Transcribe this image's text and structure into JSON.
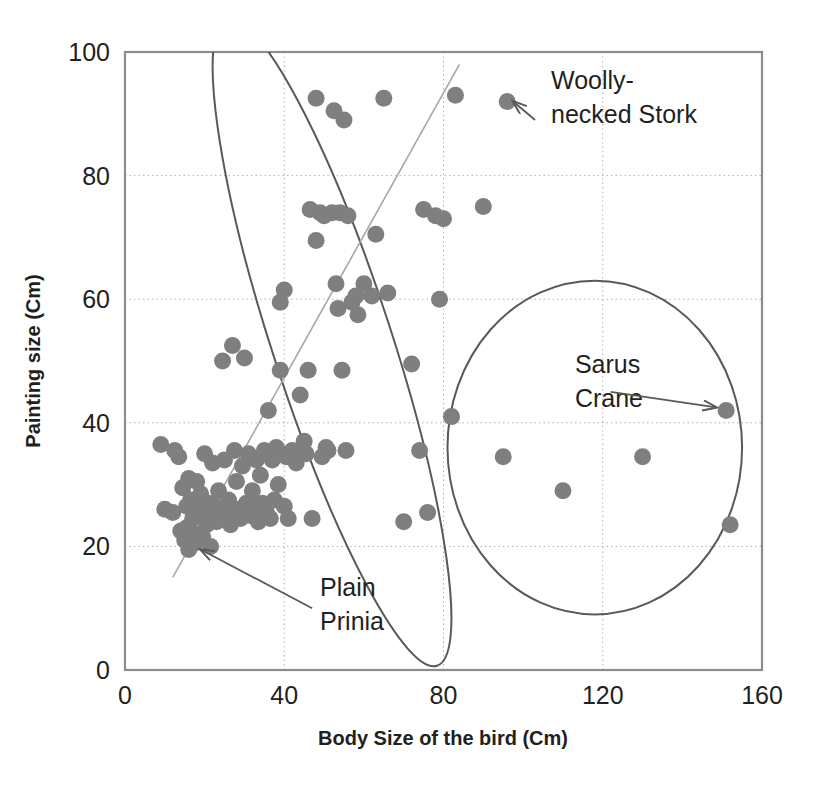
{
  "chart_data": {
    "type": "scatter",
    "title": "",
    "xlabel": "Body Size of the bird (Cm)",
    "ylabel": "Painting size (Cm)",
    "xlim": [
      0,
      160
    ],
    "ylim": [
      0,
      100
    ],
    "xticks": [
      "0",
      "40",
      "80",
      "120",
      "160"
    ],
    "yticks": [
      "0",
      "20",
      "40",
      "60",
      "80",
      "100"
    ],
    "xtick_values": [
      0,
      40,
      80,
      120,
      160
    ],
    "ytick_values": [
      0,
      20,
      40,
      60,
      80,
      100
    ],
    "grid": true,
    "legend": "none",
    "point_color": "#7f7f7f",
    "line_color": "#595959",
    "grid_color": "#b0b0b0",
    "axis_color": "#8c8c8c",
    "series": [
      {
        "name": "Bird paintings",
        "points": [
          [
            9,
            36.5
          ],
          [
            10,
            26
          ],
          [
            12,
            25.5
          ],
          [
            12.5,
            35.5
          ],
          [
            13.5,
            34.5
          ],
          [
            14,
            22.5
          ],
          [
            14.5,
            29.5
          ],
          [
            15,
            21
          ],
          [
            15.5,
            26.5
          ],
          [
            15.5,
            23
          ],
          [
            16,
            31
          ],
          [
            16,
            19.5
          ],
          [
            16.5,
            27.5
          ],
          [
            17,
            24.5
          ],
          [
            17.5,
            20.5
          ],
          [
            18,
            30.5
          ],
          [
            18,
            22
          ],
          [
            18.5,
            26
          ],
          [
            19,
            28.5
          ],
          [
            19.5,
            21.5
          ],
          [
            20,
            35
          ],
          [
            20,
            25.5
          ],
          [
            20.5,
            23.5
          ],
          [
            21,
            27
          ],
          [
            21.5,
            20
          ],
          [
            22,
            33.5
          ],
          [
            22.5,
            26.5
          ],
          [
            23,
            24
          ],
          [
            23.5,
            29
          ],
          [
            24,
            26
          ],
          [
            24.5,
            50
          ],
          [
            25,
            34
          ],
          [
            25.5,
            25.5
          ],
          [
            26,
            27.5
          ],
          [
            26.5,
            23.5
          ],
          [
            27,
            52.5
          ],
          [
            27.5,
            35.5
          ],
          [
            28,
            30.5
          ],
          [
            28.5,
            26
          ],
          [
            29,
            24.5
          ],
          [
            29.5,
            33
          ],
          [
            30,
            50.5
          ],
          [
            30.5,
            27
          ],
          [
            31,
            35
          ],
          [
            31.5,
            25
          ],
          [
            32,
            29
          ],
          [
            32.5,
            26.5
          ],
          [
            33,
            34
          ],
          [
            33.5,
            24
          ],
          [
            34,
            31.5
          ],
          [
            34.5,
            27
          ],
          [
            35,
            35.5
          ],
          [
            35.5,
            25.5
          ],
          [
            36,
            42
          ],
          [
            36.5,
            24.5
          ],
          [
            37,
            34
          ],
          [
            37.5,
            27.5
          ],
          [
            38,
            36
          ],
          [
            38.5,
            30
          ],
          [
            39,
            48.5
          ],
          [
            39,
            59.5
          ],
          [
            39.5,
            35
          ],
          [
            40,
            61.5
          ],
          [
            40,
            26.5
          ],
          [
            40.5,
            34.5
          ],
          [
            41,
            24.5
          ],
          [
            42,
            35.5
          ],
          [
            43,
            33.5
          ],
          [
            44,
            44.5
          ],
          [
            45,
            37
          ],
          [
            45.5,
            35
          ],
          [
            46,
            48.5
          ],
          [
            46.5,
            74.5
          ],
          [
            47,
            24.5
          ],
          [
            48,
            69.5
          ],
          [
            48,
            92.5
          ],
          [
            49,
            74
          ],
          [
            49.5,
            34.5
          ],
          [
            50,
            73.5
          ],
          [
            50.5,
            36
          ],
          [
            51,
            35.5
          ],
          [
            52,
            74
          ],
          [
            52.5,
            90.5
          ],
          [
            53,
            62.5
          ],
          [
            53.5,
            58.5
          ],
          [
            54,
            74
          ],
          [
            54.5,
            48.5
          ],
          [
            55,
            89
          ],
          [
            55.5,
            35.5
          ],
          [
            56,
            73.5
          ],
          [
            57,
            59.5
          ],
          [
            58,
            60.5
          ],
          [
            58.5,
            57.5
          ],
          [
            60,
            62.5
          ],
          [
            62,
            60.5
          ],
          [
            63,
            70.5
          ],
          [
            65,
            92.5
          ],
          [
            66,
            61
          ],
          [
            70,
            24
          ],
          [
            72,
            49.5
          ],
          [
            74,
            35.5
          ],
          [
            75,
            74.5
          ],
          [
            76,
            25.5
          ],
          [
            78,
            73.5
          ],
          [
            79,
            60
          ],
          [
            80,
            73
          ],
          [
            82,
            41
          ],
          [
            83,
            93
          ],
          [
            90,
            75
          ],
          [
            95,
            34.5
          ],
          [
            96,
            92
          ],
          [
            110,
            29
          ],
          [
            130,
            34.5
          ],
          [
            151,
            42
          ],
          [
            152,
            23.5
          ]
        ]
      }
    ],
    "ellipses": [
      {
        "name": "small-bird-cluster-ellipse",
        "cx": 52,
        "cy": 53,
        "rx": 15,
        "ry": 55,
        "rotation": -18
      },
      {
        "name": "large-bird-cluster-ellipse",
        "cx": 118,
        "cy": 36,
        "rx": 37,
        "ry": 27,
        "rotation": 0
      }
    ],
    "trendline": {
      "x1": 12,
      "y1": 15,
      "x2": 84,
      "y2": 98
    },
    "annotations": [
      {
        "id": "woolly-necked-stork",
        "text": "Woolly-necked Stork",
        "lines": [
          "Woolly-",
          "necked Stork"
        ],
        "text_x": 107,
        "text_y": 94,
        "arrow_from_x": 103,
        "arrow_from_y": 89,
        "arrow_to_x": 97.5,
        "arrow_to_y": 92
      },
      {
        "id": "sarus-crane",
        "text": "Sarus Crane",
        "lines": [
          "Sarus",
          "Crane"
        ],
        "text_x": 113,
        "text_y": 48,
        "arrow_from_x": 122,
        "arrow_from_y": 45,
        "arrow_to_x": 148.5,
        "arrow_to_y": 42.5
      },
      {
        "id": "plain-prinia",
        "text": "Plain Prinia",
        "lines": [
          "Plain",
          "Prinia"
        ],
        "text_x": 49,
        "text_y": 12,
        "arrow_from_x": 47,
        "arrow_from_y": 10,
        "arrow_to_x": 19,
        "arrow_to_y": 19.5
      }
    ]
  }
}
